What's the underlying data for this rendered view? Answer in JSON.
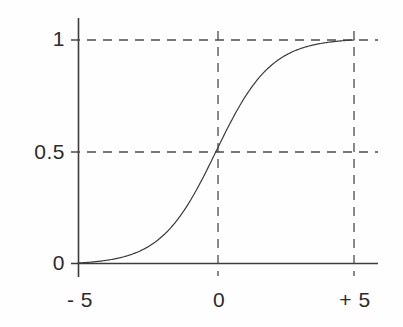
{
  "chart_data": {
    "type": "line",
    "title": "",
    "subtitle": "",
    "xlabel": "",
    "ylabel": "",
    "xlim": [
      -6.2,
      6.3
    ],
    "ylim": [
      -0.08,
      1.1
    ],
    "grid": true,
    "legend": null,
    "x_ticks": [
      {
        "value": -5,
        "label": "- 5"
      },
      {
        "value": 0,
        "label": "0"
      },
      {
        "value": 5,
        "label": "+ 5"
      }
    ],
    "y_ticks": [
      {
        "value": 0,
        "label": "0"
      },
      {
        "value": 0.5,
        "label": "0.5"
      },
      {
        "value": 1,
        "label": "1"
      }
    ],
    "gridlines": {
      "horizontal": [
        1,
        0.5
      ],
      "vertical": [
        0,
        5
      ],
      "style": "dashed"
    },
    "series": [
      {
        "name": "sigmoid",
        "function": "logistic",
        "color": "#3c3c3c",
        "linewidth": 1.2,
        "x": [
          -5,
          -4.5,
          -4,
          -3.5,
          -3,
          -2.5,
          -2,
          -1.5,
          -1,
          -0.5,
          0,
          0.5,
          1,
          1.5,
          2,
          2.5,
          3,
          3.5,
          4,
          4.5,
          5
        ],
        "values": [
          0.0,
          0.012,
          0.027,
          0.045,
          0.069,
          0.1,
          0.142,
          0.198,
          0.269,
          0.369,
          0.5,
          0.631,
          0.731,
          0.802,
          0.858,
          0.9,
          0.931,
          0.955,
          0.973,
          0.988,
          1.0
        ]
      }
    ],
    "axes": {
      "x_axis_color": "#3c3c3c",
      "y_axis_color": "#3c3c3c",
      "grid_color": "#555555"
    }
  },
  "figure": {
    "background": "#fefefe",
    "foreground": "#2b2b2b"
  }
}
